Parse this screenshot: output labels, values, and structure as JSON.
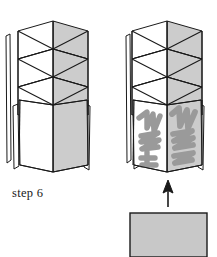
{
  "figure": {
    "caption": "step 6",
    "colors": {
      "background": "#ffffff",
      "stroke": "#1a1a1a",
      "panel_light": "#ffffff",
      "panel_shaded": "#cccccc",
      "scribble": "#9a9a9a",
      "insert_sheet": "#c8c8c8"
    },
    "left_structure": {
      "name": "folded-cylinder-plain",
      "description": "cylindrical zigzag accordion-folded paper structure, plain panels"
    },
    "right_structure": {
      "name": "folded-cylinder-decorated",
      "description": "cylindrical zigzag accordion-folded paper structure with scribble decoration on lower panels",
      "scribbles": [
        {
          "name": "scribble-left-panel"
        },
        {
          "name": "scribble-right-panel"
        }
      ]
    },
    "arrow": {
      "name": "insert-arrow",
      "direction": "up"
    },
    "insert_sheet": {
      "name": "insert-sheet",
      "description": "gray rectangular sheet to be inserted upward"
    }
  }
}
